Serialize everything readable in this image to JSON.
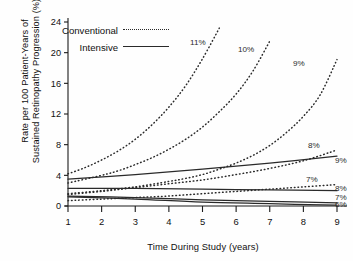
{
  "chart_data": {
    "type": "line",
    "title": "",
    "xlabel": "Time During Study (years)",
    "ylabel": "Rate per 100 Patient-Years of Sustained Retinopathy Progression (%)",
    "ylabel_line1": "Rate per 100 Patient-Years of",
    "ylabel_line2": "Sustained Retinopathy Progression (%)",
    "xlim": [
      1,
      9
    ],
    "ylim": [
      0,
      24
    ],
    "xticks": [
      1,
      2,
      3,
      4,
      5,
      6,
      7,
      8,
      9
    ],
    "yticks": [
      0,
      4,
      8,
      12,
      16,
      20,
      24
    ],
    "xtick_labels": [
      "1",
      "2",
      "3",
      "4",
      "5",
      "6",
      "7",
      "8",
      "9"
    ],
    "ytick_labels": [
      "0",
      "4",
      "8",
      "12",
      "16",
      "20",
      "24"
    ],
    "grid": false,
    "legend_position": "top-left",
    "legend": [
      {
        "name": "Conventional",
        "style": "dotted"
      },
      {
        "name": "Intensive",
        "style": "solid"
      }
    ],
    "series": [
      {
        "name": "Conventional 11%",
        "label": "11%",
        "style": "dotted",
        "x": [
          1,
          1.5,
          2,
          2.5,
          3,
          3.5,
          4,
          4.5,
          5,
          5.5
        ],
        "values": [
          4.2,
          5.0,
          6.0,
          7.2,
          8.7,
          10.6,
          12.9,
          15.7,
          19.2,
          23.2
        ]
      },
      {
        "name": "Conventional 10%",
        "label": "10%",
        "style": "dotted",
        "x": [
          1,
          2,
          2.5,
          3,
          3.5,
          4,
          4.5,
          5,
          5.5,
          6,
          6.5,
          7
        ],
        "values": [
          3.0,
          4.0,
          4.6,
          5.4,
          6.3,
          7.4,
          8.7,
          10.3,
          12.3,
          14.6,
          17.6,
          21.5
        ]
      },
      {
        "name": "Conventional 9%",
        "label": "9%",
        "style": "dotted",
        "x": [
          1,
          2,
          3,
          4,
          4.5,
          5,
          5.5,
          6,
          6.5,
          7,
          7.5,
          8,
          8.5,
          9
        ],
        "values": [
          1.6,
          2.0,
          2.5,
          3.2,
          3.6,
          4.1,
          4.8,
          5.6,
          6.6,
          7.9,
          9.6,
          11.7,
          14.5,
          19.1
        ]
      },
      {
        "name": "Conventional 8%",
        "label": "8%",
        "style": "dotted",
        "x": [
          1,
          2,
          3,
          4,
          5,
          6,
          7,
          8,
          9
        ],
        "values": [
          1.5,
          1.9,
          2.4,
          2.9,
          3.4,
          4.1,
          4.9,
          5.9,
          7.3
        ]
      },
      {
        "name": "Conventional 7%",
        "label": "7%",
        "style": "dotted",
        "x": [
          1,
          2,
          3,
          4,
          5,
          6,
          7,
          8,
          9
        ],
        "values": [
          0.7,
          0.9,
          1.1,
          1.3,
          1.6,
          1.9,
          2.2,
          2.5,
          2.8
        ]
      },
      {
        "name": "Intensive 9%",
        "label": "9%",
        "style": "solid",
        "x": [
          1,
          3,
          5,
          7,
          9
        ],
        "values": [
          3.5,
          4.1,
          4.8,
          5.6,
          6.5
        ]
      },
      {
        "name": "Intensive 8%",
        "label": "8%",
        "style": "solid",
        "x": [
          1,
          3,
          5,
          7,
          9
        ],
        "values": [
          2.3,
          2.3,
          2.2,
          2.1,
          2.0
        ]
      },
      {
        "name": "Intensive 7%",
        "label": "7%",
        "style": "solid",
        "x": [
          1,
          3,
          5,
          7,
          9
        ],
        "values": [
          1.3,
          1.1,
          0.8,
          0.6,
          0.4
        ]
      },
      {
        "name": "Intensive 6%",
        "label": "6%",
        "style": "solid",
        "x": [
          1,
          3,
          5,
          7,
          9
        ],
        "values": [
          1.2,
          0.9,
          0.5,
          0.3,
          0.1
        ]
      }
    ],
    "annotations": [
      {
        "text": "11%",
        "x": 190,
        "y": 45
      },
      {
        "text": "10%",
        "x": 238,
        "y": 52
      },
      {
        "text": "9%",
        "x": 293,
        "y": 66
      },
      {
        "text": "8%",
        "x": 308,
        "y": 148
      },
      {
        "text": "9%",
        "x": 335,
        "y": 163
      },
      {
        "text": "7%",
        "x": 306,
        "y": 182
      },
      {
        "text": "8%",
        "x": 335,
        "y": 191
      },
      {
        "text": "7%",
        "x": 335,
        "y": 200
      },
      {
        "text": "6%",
        "x": 335,
        "y": 207
      }
    ],
    "colors": {
      "axis": "#1a1a1a",
      "conventional": "#2a2a2a",
      "intensive": "#2a2a2a",
      "background": "#fefefe"
    }
  }
}
